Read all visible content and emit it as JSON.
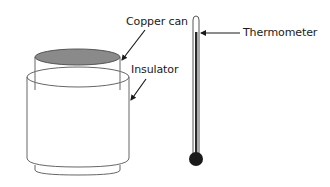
{
  "diagram": {
    "type": "apparatus-diagram",
    "labels": {
      "copper_can": "Copper can",
      "insulator": "Insulator",
      "thermometer": "Thermometer"
    },
    "components": [
      {
        "name": "copper can",
        "description": "cylindrical can with dark grey filled top"
      },
      {
        "name": "insulator",
        "description": "wider cylinder surrounding the copper can with a base rim"
      },
      {
        "name": "thermometer",
        "description": "vertical glass thermometer with dark column and black bulb"
      }
    ],
    "colors": {
      "outline": "#555555",
      "copper_top_fill": "#8a8a8a",
      "thermometer_column": "#2a2a2a",
      "bulb": "#1a1a1a",
      "arrow": "#1a1a1a"
    }
  }
}
